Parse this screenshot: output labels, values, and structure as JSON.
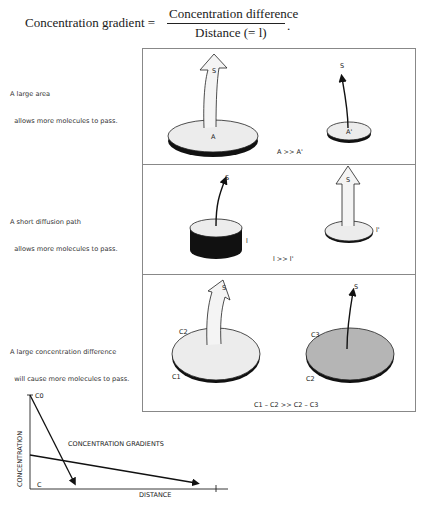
{
  "formula": {
    "lhs": "Concentration gradient =",
    "numerator": "Concentration difference",
    "denominator": "Distance (= l)",
    "terminator": "."
  },
  "panels": [
    {
      "caption_line1": "A large area",
      "caption_line2": "  allows more molecules to pass.",
      "left_label": "A",
      "right_label": "A'",
      "flux_label": "S",
      "relation": "A >> A'"
    },
    {
      "caption_line1": "A short diffusion path",
      "caption_line2": "  allows more molecules to pass.",
      "left_label": "l",
      "right_label": "l'",
      "flux_label": "S",
      "relation": "l >> l'"
    },
    {
      "caption_line1": "A large concentration difference",
      "caption_line2": "  will cause more molecules to pass.",
      "left_top_label": "C2",
      "left_bottom_label": "C1",
      "right_top_label": "C3",
      "right_bottom_label": "C2",
      "flux_label": "S",
      "relation": "C1 – C2 >> C2 – C3"
    }
  ],
  "graph": {
    "y_axis_label": "CONCENTRATION",
    "x_axis_label": "DISTANCE",
    "title": "CONCENTRATION GRADIENTS",
    "c0_label": "C0",
    "c_label": "C"
  },
  "colors": {
    "disk_light": "#ececec",
    "disk_shaded": "#b5b5b5",
    "disk_edge": "#111111",
    "panel_border": "#888888"
  }
}
